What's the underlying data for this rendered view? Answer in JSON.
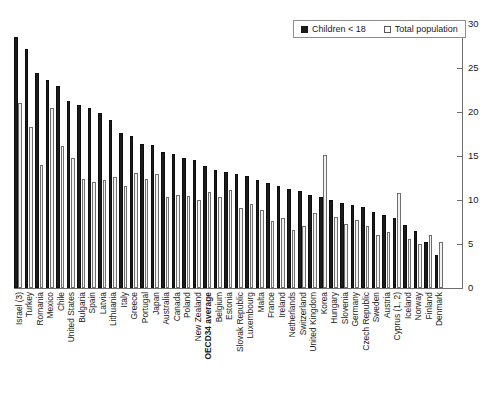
{
  "legend": {
    "position": "top-right",
    "entries": [
      {
        "label": "Children < 18",
        "marker": "filled-square-icon",
        "color": "#1c1c1c"
      },
      {
        "label": "Total population",
        "marker": "open-square-icon",
        "color": "#f2f2f2"
      }
    ]
  },
  "axis": {
    "y_ticks": [
      "0",
      "5",
      "10",
      "15",
      "20",
      "25",
      "30"
    ]
  },
  "chart_data": {
    "type": "bar",
    "title": "",
    "subtitle": "",
    "xlabel": "",
    "ylabel": "",
    "ylim": [
      0,
      30
    ],
    "ytick_values": [
      0,
      5,
      10,
      15,
      20,
      25,
      30
    ],
    "grid": false,
    "legend_position": "top-right",
    "orientation": "vertical",
    "grouping": "grouped",
    "highlight_category": "OECD34 average",
    "categories": [
      "Israel (3)",
      "Turkey",
      "Romania",
      "Mexico",
      "Chile",
      "United States",
      "Bulgaria",
      "Spain",
      "Latvia",
      "Lithuania",
      "Italy",
      "Greece",
      "Portugal",
      "Japan",
      "Australia",
      "Canada",
      "Poland",
      "New Zealand",
      "OECD34 average",
      "Belgium",
      "Estonia",
      "Slovak Republic",
      "Luxembourg",
      "Malta",
      "France",
      "Ireland",
      "Netherlands",
      "Switzerland",
      "United Kingdom",
      "Korea",
      "Hungary",
      "Slovenia",
      "Germany",
      "Czech Republic",
      "Sweden",
      "Austria",
      "Cyprus (1, 2)",
      "Iceland",
      "Norway",
      "Finland",
      "Denmark"
    ],
    "series": [
      {
        "name": "Children < 18",
        "color": "#1c1c1c",
        "values": [
          28.5,
          27.2,
          24.4,
          23.6,
          22.9,
          21.2,
          20.8,
          20.4,
          19.9,
          19.1,
          17.6,
          17.3,
          16.4,
          16.3,
          15.5,
          15.2,
          14.8,
          14.5,
          13.9,
          13.4,
          13.2,
          13.0,
          12.7,
          12.3,
          11.9,
          11.6,
          11.3,
          11.0,
          10.6,
          10.3,
          10.0,
          9.7,
          9.4,
          9.2,
          8.6,
          8.3,
          7.9,
          7.2,
          6.5,
          5.2,
          3.7
        ]
      },
      {
        "name": "Total population",
        "color": "#f2f2f2",
        "values": [
          21.0,
          18.3,
          14.0,
          20.4,
          16.1,
          14.8,
          12.4,
          12.1,
          12.3,
          12.6,
          11.6,
          13.1,
          12.4,
          13.0,
          10.3,
          10.6,
          10.5,
          10.0,
          10.9,
          10.3,
          11.1,
          9.1,
          9.5,
          8.9,
          7.6,
          8.0,
          6.6,
          7.1,
          8.5,
          15.1,
          8.1,
          7.3,
          7.7,
          7.0,
          6.0,
          6.4,
          10.8,
          5.6,
          5.0,
          6.0,
          5.2
        ]
      }
    ]
  }
}
